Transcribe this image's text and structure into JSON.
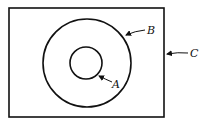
{
  "diagram": {
    "type": "nested-sets",
    "shapes": {
      "rectangle": {
        "label": "C",
        "x": 9,
        "y": 8,
        "width": 155,
        "height": 109
      },
      "outer_circle": {
        "label": "B",
        "cx": 87,
        "cy": 63,
        "r": 44
      },
      "inner_circle": {
        "label": "A",
        "cx": 86,
        "cy": 63,
        "r": 16
      }
    },
    "labels": {
      "a": "A",
      "b": "B",
      "c": "C"
    },
    "stroke_color": "#111111"
  }
}
